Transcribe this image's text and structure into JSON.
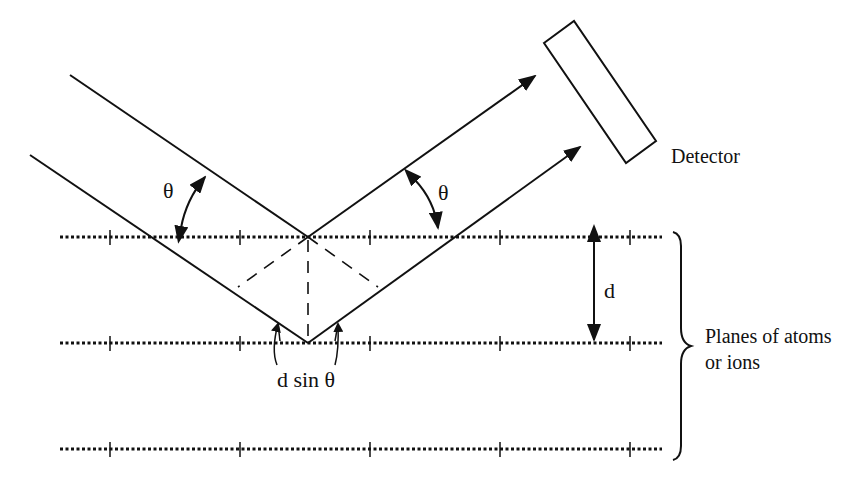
{
  "diagram": {
    "labels": {
      "theta_incident": "θ",
      "theta_reflected": "θ",
      "detector": "Detector",
      "spacing": "d",
      "path_difference": "d sin θ",
      "planes_line1": "Planes of atoms",
      "planes_line2": "or ions"
    },
    "planes": {
      "count": 3,
      "y_positions": [
        237,
        343,
        449
      ],
      "x_start": 60,
      "x_end": 662,
      "tick_x_positions": [
        110,
        240,
        370,
        500,
        630
      ]
    },
    "beams": [
      {
        "name": "upper-beam",
        "incident_start": [
          70,
          75
        ],
        "reflection_point": [
          308,
          237
        ],
        "reflected_end": [
          537,
          74
        ]
      },
      {
        "name": "lower-beam",
        "incident_start": [
          30,
          155
        ],
        "reflection_point": [
          308,
          343
        ],
        "reflected_end": [
          582,
          145
        ]
      }
    ],
    "colors": {
      "line": "#111111",
      "background": "#ffffff"
    }
  }
}
